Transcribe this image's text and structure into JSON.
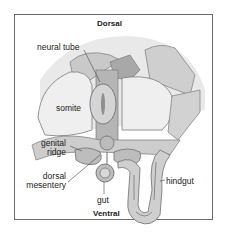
{
  "diagram": {
    "title_top": "Dorsal",
    "title_bottom": "Ventral",
    "labels": {
      "neural_tube": "neural tube",
      "somite": "somite",
      "genital_ridge_line1": "genital",
      "genital_ridge_line2": "ridge",
      "dorsal_mesentery_line1": "dorsal",
      "dorsal_mesentery_line2": "mesentery",
      "gut": "gut",
      "hindgut": "hindgut"
    },
    "colors": {
      "background_blob": "#e9e9e9",
      "tissue_light": "#d6d6d6",
      "tissue_mid": "#bdbdbd",
      "tissue_dark": "#9a9a9a",
      "somite": "#efefef",
      "outline": "#6e6e6e",
      "frame": "#6b6b6b"
    }
  }
}
